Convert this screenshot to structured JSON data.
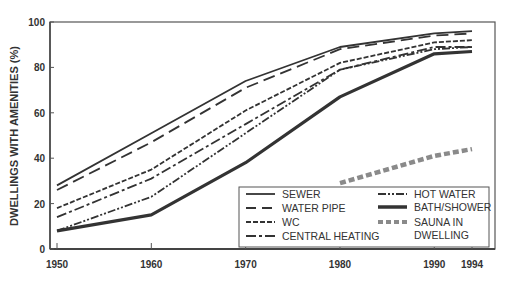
{
  "chart_data": {
    "type": "line",
    "title": "",
    "xlabel": "",
    "ylabel": "DWELLINGS WITH AMENITIES (%)",
    "x": [
      1950,
      1960,
      1970,
      1980,
      1990,
      1994
    ],
    "x_tick_labels": [
      "1950",
      "1960",
      "1970",
      "1980",
      "1990",
      "1994"
    ],
    "y_tick_labels": [
      "0",
      "20",
      "40",
      "60",
      "80",
      "100"
    ],
    "ylim": [
      0,
      100
    ],
    "xlim": [
      1950,
      1994
    ],
    "grid": false,
    "legend_position": "lower right (inside)",
    "series": [
      {
        "name": "SEWER",
        "style": "solid",
        "values": [
          28,
          51,
          74,
          89,
          95,
          96
        ]
      },
      {
        "name": "WATER PIPE",
        "style": "long-dash",
        "values": [
          26,
          47,
          71,
          88,
          94,
          95
        ]
      },
      {
        "name": "WC",
        "style": "short-dash",
        "values": [
          18,
          35,
          61,
          82,
          91,
          92
        ]
      },
      {
        "name": "CENTRAL HEATING",
        "style": "dash-dot",
        "values": [
          14,
          31,
          55,
          79,
          89,
          89
        ]
      },
      {
        "name": "HOT WATER",
        "style": "dash-dot-dot",
        "values": [
          8,
          23,
          51,
          79,
          88,
          89
        ]
      },
      {
        "name": "BATH/SHOWER",
        "style": "thick-solid",
        "values": [
          8,
          15,
          38,
          67,
          86,
          87
        ]
      },
      {
        "name": "SAUNA IN DWELLING",
        "style": "thick-grey-dash",
        "values": [
          null,
          null,
          null,
          29,
          41,
          44
        ]
      }
    ]
  },
  "legend": {
    "left": [
      "SEWER",
      "WATER PIPE",
      "WC",
      "CENTRAL HEATING"
    ],
    "right": [
      "HOT WATER",
      "BATH/SHOWER",
      "SAUNA IN",
      "DWELLING"
    ]
  },
  "colors": {
    "line": "#333333",
    "sauna": "#8a8a8a",
    "axis": "#444444"
  }
}
